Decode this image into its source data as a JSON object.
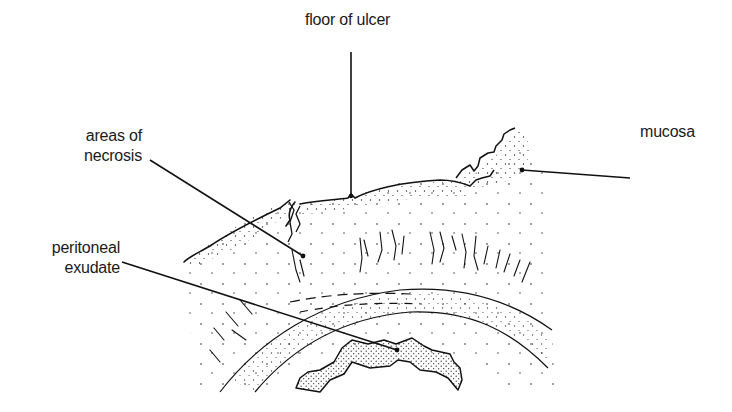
{
  "figure": {
    "type": "anatomical line drawing",
    "ink_color": "#111111",
    "background": "#ffffff"
  },
  "labels": {
    "floor_of_ulcer": "floor of ulcer",
    "areas_of_necrosis_line1": "areas of",
    "areas_of_necrosis_line2": "necrosis",
    "mucosa": "mucosa",
    "peritoneal_exudate_line1": "peritoneal",
    "peritoneal_exudate_line2": "exudate"
  },
  "leaders": [
    {
      "label": "floor of ulcer",
      "from": [
        351,
        52
      ],
      "to": [
        351,
        196
      ]
    },
    {
      "label": "areas of necrosis",
      "from": [
        150,
        160
      ],
      "to": [
        303,
        256
      ]
    },
    {
      "label": "mucosa",
      "from": [
        630,
        178
      ],
      "to": [
        522,
        170
      ]
    },
    {
      "label": "peritoneal exudate",
      "from": [
        122,
        262
      ],
      "to": [
        397,
        350
      ]
    }
  ]
}
